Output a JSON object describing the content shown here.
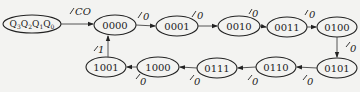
{
  "diagram": {
    "type": "state-transition",
    "legend_node": {
      "label": "Q3Q2Q1Q0",
      "parts": [
        "Q",
        "3",
        "Q",
        "2",
        "Q",
        "1",
        "Q",
        "0"
      ]
    },
    "legend_output": "CO",
    "states": [
      {
        "id": "s0",
        "label": "0000"
      },
      {
        "id": "s1",
        "label": "0001"
      },
      {
        "id": "s2",
        "label": "0010"
      },
      {
        "id": "s3",
        "label": "0011"
      },
      {
        "id": "s4",
        "label": "0100"
      },
      {
        "id": "s5",
        "label": "0101"
      },
      {
        "id": "s6",
        "label": "0110"
      },
      {
        "id": "s7",
        "label": "0111"
      },
      {
        "id": "s8",
        "label": "1000"
      },
      {
        "id": "s9",
        "label": "1001"
      }
    ],
    "transitions": [
      {
        "from": "0000",
        "to": "0001",
        "output": "0"
      },
      {
        "from": "0001",
        "to": "0010",
        "output": "0"
      },
      {
        "from": "0010",
        "to": "0011",
        "output": "0"
      },
      {
        "from": "0011",
        "to": "0100",
        "output": "0"
      },
      {
        "from": "0100",
        "to": "0101",
        "output": "0"
      },
      {
        "from": "0101",
        "to": "0110",
        "output": "0"
      },
      {
        "from": "0110",
        "to": "0111",
        "output": "0"
      },
      {
        "from": "0111",
        "to": "1000",
        "output": "0"
      },
      {
        "from": "1000",
        "to": "1001",
        "output": "0"
      },
      {
        "from": "1001",
        "to": "0000",
        "output": "1"
      }
    ]
  }
}
